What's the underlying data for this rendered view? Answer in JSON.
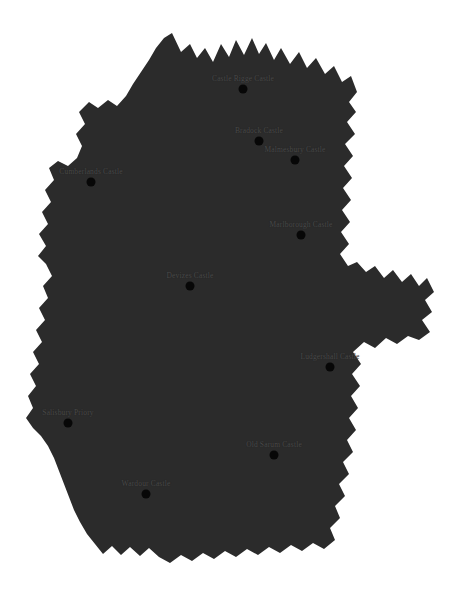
{
  "map": {
    "title": "Wiltshire castle sites map",
    "region_name": "Wiltshire",
    "background_color": "#ffffff",
    "region_fill_color": "#2b2b2b",
    "marker_color": "#070707",
    "label_color": "#4a4a4a",
    "canvas": {
      "width": 465,
      "height": 607
    },
    "sites": [
      {
        "label": "Castle Rigge Castle",
        "x": 243,
        "y": 89,
        "label_align": "center"
      },
      {
        "label": "Bradock Castle",
        "x": 259,
        "y": 141,
        "label_align": "center"
      },
      {
        "label": "Malmesbury Castle",
        "x": 295,
        "y": 160,
        "label_align": "center"
      },
      {
        "label": "Cumberlands Castle",
        "x": 91,
        "y": 182,
        "label_align": "center"
      },
      {
        "label": "Marlborough Castle",
        "x": 301,
        "y": 235,
        "label_align": "center"
      },
      {
        "label": "Devizes Castle",
        "x": 190,
        "y": 286,
        "label_align": "center"
      },
      {
        "label": "Ludgershall Castle",
        "x": 330,
        "y": 367,
        "label_align": "center"
      },
      {
        "label": "Salisbury Priory",
        "x": 68,
        "y": 423,
        "label_align": "center"
      },
      {
        "label": "Old Sarum Castle",
        "x": 274,
        "y": 455,
        "label_align": "center"
      },
      {
        "label": "Wardour Castle",
        "x": 146,
        "y": 494,
        "label_align": "center"
      }
    ]
  }
}
